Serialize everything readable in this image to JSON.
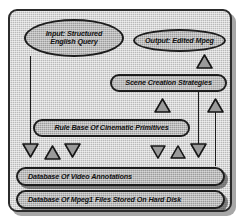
{
  "diagram": {
    "frame": {
      "name": "system-boundary"
    },
    "nodes": [
      {
        "id": "input",
        "label": "Input: Structured English Query",
        "shape": "ellipse"
      },
      {
        "id": "output",
        "label": "Output: Edited Mpeg",
        "shape": "ellipse"
      },
      {
        "id": "strategies",
        "label": "Scene Creation Strategies",
        "shape": "stadium"
      },
      {
        "id": "rulebase",
        "label": "Rule Base Of Cinematic Primitives",
        "shape": "stadium"
      },
      {
        "id": "annotdb",
        "label": "Database Of Video Annotations",
        "shape": "bar"
      },
      {
        "id": "mpegdb",
        "label": "Database Of Mpeg1 Files Stored On Hard Disk",
        "shape": "bar"
      }
    ],
    "arrows": [
      {
        "id": "a1",
        "direction": "down",
        "from": "input",
        "to": "annotdb"
      },
      {
        "id": "a2",
        "direction": "up",
        "from": "annotdb",
        "to": "rulebase"
      },
      {
        "id": "a3",
        "direction": "down",
        "from": "rulebase",
        "to": "annotdb"
      },
      {
        "id": "a4",
        "direction": "down",
        "from": "rulebase",
        "to": "annotdb"
      },
      {
        "id": "a5",
        "direction": "up",
        "from": "annotdb",
        "to": "rulebase"
      },
      {
        "id": "a6",
        "direction": "down",
        "from": "strategies",
        "to": "mpegdb"
      },
      {
        "id": "a7",
        "direction": "up",
        "from": "mpegdb",
        "to": "output"
      },
      {
        "id": "a8",
        "direction": "up",
        "from": "rulebase",
        "to": "strategies"
      },
      {
        "id": "a9",
        "direction": "up",
        "from": "strategies",
        "to": "output"
      }
    ],
    "colors": {
      "outline": "#1d1d1d",
      "fill": "#b9b9b9",
      "fill_dark": "#9c9c9c",
      "background": "#ffffff",
      "shadow": "#5a5a5a"
    }
  }
}
